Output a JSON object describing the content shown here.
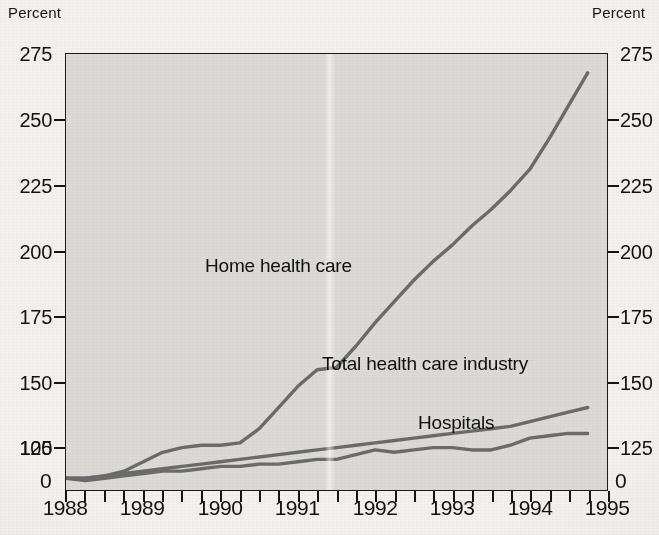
{
  "axes": {
    "unit_left": "Percent",
    "unit_right": "Percent",
    "y_ticks": [
      "275",
      "250",
      "225",
      "200",
      "175",
      "150",
      "125",
      "100"
    ],
    "y_zero_left": "0",
    "y_zero_right": "0",
    "x_ticks": [
      "1988",
      "1989",
      "1990",
      "1991",
      "1992",
      "1993",
      "1994",
      "1995"
    ]
  },
  "series_labels": {
    "home": "Home health care",
    "total": "Total health care industry",
    "hospitals": "Hospitals"
  },
  "bleed_text": {
    "line1": "CHAPTER 4   HEALTH CARE",
    "line2": "increase in cost per able day",
    "line3": "rise over the market support",
    "line4": "offset expenses to people can",
    "line5": "medical benefits"
  },
  "colors": {
    "plot_background": "#dbdad7",
    "page_background": "#f2f1ef",
    "line": "#6b6b6b",
    "axis": "#1b1b1b",
    "text": "#111111"
  },
  "chart_data": {
    "type": "line",
    "title": "",
    "subtitle": "",
    "xlabel": "",
    "ylabel": "Percent",
    "y2label": "Percent",
    "xlim": [
      1988.0,
      1995.0
    ],
    "ylim": [
      95,
      280
    ],
    "y_axis_break_at_zero": true,
    "grid": false,
    "legend": "inline-labels",
    "x_tick_interval_years": 1,
    "minor_tick_interval_years": 0.25,
    "x": [
      1988.0,
      1988.25,
      1988.5,
      1988.75,
      1989.0,
      1989.25,
      1989.5,
      1989.75,
      1990.0,
      1990.25,
      1990.5,
      1990.75,
      1991.0,
      1991.25,
      1991.5,
      1991.75,
      1992.0,
      1992.25,
      1992.5,
      1992.75,
      1993.0,
      1993.25,
      1993.5,
      1993.75,
      1994.0,
      1994.25,
      1994.5,
      1994.75
    ],
    "series": [
      {
        "name": "Home health care",
        "color": "#6b6b6b",
        "end_value": 272,
        "values": [
          100,
          100,
          101,
          103,
          107,
          111,
          113,
          114,
          114,
          115,
          121,
          130,
          139,
          146,
          147,
          156,
          166,
          175,
          184,
          192,
          199,
          207,
          214,
          222,
          231,
          244,
          258,
          272
        ]
      },
      {
        "name": "Total health care industry",
        "color": "#6b6b6b",
        "end_value": 130,
        "values": [
          100,
          100,
          101,
          102,
          103,
          104,
          105,
          106,
          107,
          108,
          109,
          110,
          111,
          112,
          113,
          114,
          115,
          116,
          117,
          118,
          119,
          120,
          121,
          122,
          124,
          126,
          128,
          130
        ]
      },
      {
        "name": "Hospitals",
        "color": "#6b6b6b",
        "end_value": 119,
        "values": [
          100,
          99,
          100,
          101,
          102,
          103,
          103,
          104,
          105,
          105,
          106,
          106,
          107,
          108,
          108,
          110,
          112,
          111,
          112,
          113,
          113,
          112,
          112,
          114,
          117,
          118,
          119,
          119
        ]
      }
    ]
  }
}
